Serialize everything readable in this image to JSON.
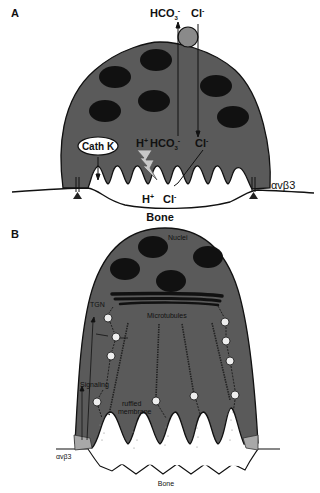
{
  "panels": {
    "a": {
      "letter": "A",
      "top_ions": {
        "bicarbonate": "HCO",
        "bicarb_sub": "3",
        "bicarb_sup": "-",
        "chloride": "Cl",
        "chloride_sup": "-"
      },
      "inner_ions": {
        "proton": "H",
        "proton_sup": "+",
        "bicarbonate": "HCO",
        "bicarb_sub": "3",
        "bicarb_sup": "-",
        "chloride": "Cl",
        "chloride_sup": "-"
      },
      "lacuna_ions": {
        "proton": "H",
        "proton_sup": "+",
        "chloride": "Cl",
        "chloride_sup": "-"
      },
      "enzyme": "Cath K",
      "integrin": "αvβ3",
      "substrate": "Bone"
    },
    "b": {
      "letter": "B",
      "nuclei": "Nuclei",
      "golgi": "TGN",
      "microtubules": "Microtubules",
      "signaling": "Signaling",
      "ruffled_membrane_line1": "ruffled",
      "ruffled_membrane_line2": "membrane",
      "integrin": "αvβ3",
      "substrate": "Bone"
    }
  },
  "colors": {
    "cell_body": "#5a5a5a",
    "nucleus": "#111111",
    "sealing_zone": "#a8a8a8",
    "exchanger": "#8a8a8a",
    "proton_pump": "#c8c8c8",
    "background": "#ffffff"
  }
}
